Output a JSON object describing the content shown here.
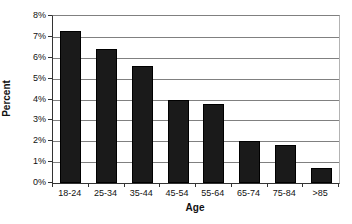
{
  "chart_data": {
    "type": "bar",
    "categories": [
      "18-24",
      "25-34",
      "35-44",
      "45-54",
      "55-64",
      "65-74",
      "75-84",
      ">85"
    ],
    "values": [
      7.3,
      6.4,
      5.6,
      4.0,
      3.8,
      2.0,
      1.8,
      0.7
    ],
    "title": "",
    "xlabel": "Age",
    "ylabel": "Percent",
    "ylim": [
      0,
      8
    ],
    "ytick_step": 1,
    "ytick_labels": [
      "0%",
      "1%",
      "2%",
      "3%",
      "4%",
      "5%",
      "6%",
      "7%",
      "8%"
    ],
    "grid": true,
    "legend": false,
    "bar_width_px": 21,
    "colors": {
      "bar": "#1a1a1a",
      "gridline": "#808080",
      "axis": "#333333",
      "plot_right_border": "#b3b3b3",
      "background": "#ffffff",
      "text": "#111111"
    }
  }
}
